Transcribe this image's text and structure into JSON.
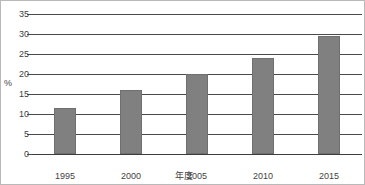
{
  "chart_data": {
    "type": "bar",
    "title": "",
    "xlabel": "年度",
    "ylabel": "%",
    "categories": [
      "1995",
      "2000",
      "2005",
      "2010",
      "2015"
    ],
    "values": [
      11.5,
      16,
      20,
      24,
      29.5
    ],
    "ylim": [
      0,
      35
    ],
    "ytick_step": 5,
    "yticks": [
      "35",
      "30",
      "25",
      "20",
      "15",
      "10",
      "5",
      "0"
    ],
    "ytick_values": [
      35,
      30,
      25,
      20,
      15,
      10,
      5,
      0
    ],
    "grid": true,
    "legend": false,
    "legend_position": "none",
    "bar_color": "#808080",
    "bar_edge_color": "#6f6f6f",
    "gridline_color": "#4a4a4a",
    "series": [
      {
        "name": "",
        "values": [
          11.5,
          16,
          20,
          24,
          29.5
        ]
      }
    ],
    "annotations": []
  },
  "figure": {
    "title_clipped": "",
    "border_color": "#b9b9b9",
    "background": "#ffffff"
  }
}
